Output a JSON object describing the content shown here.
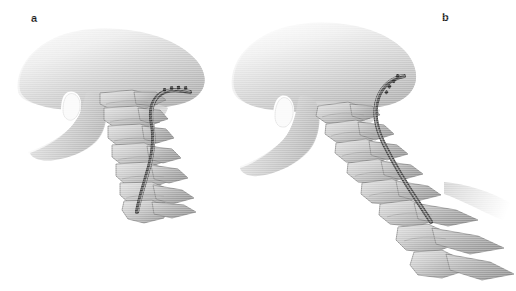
{
  "figure": {
    "background_color": "#ffffff",
    "width": 516,
    "height": 291,
    "type": "medical-illustration",
    "view": "lateral oblique",
    "palette": {
      "background": "#ffffff",
      "bone_light": "#d9d9d9",
      "bone_mid": "#b4b4b4",
      "bone_shadow": "#8e8e8e",
      "bone_outline": "#6e6e6e",
      "soft_tissue_light": "#ededed",
      "soft_tissue_mid": "#c6c6c6",
      "soft_tissue_shadow": "#a0a0a0",
      "lead_dark": "#4a4a4a",
      "lead_mid": "#7a7a7a",
      "lead_highlight": "#cfcfcf",
      "label_text": "#1a1a1a"
    }
  },
  "panels": [
    {
      "id": "a",
      "label": "a",
      "label_x": 31,
      "label_y": 13,
      "posture": "neutral / flexed",
      "description": "Lateral view of skull base, mandible and cervical spine in neutral position with the stimulator lead looped over the occiput and running caudally along the posterior cervical spine.",
      "elements": [
        "skull",
        "mandible",
        "cervical-vertebrae",
        "stimulator-lead"
      ],
      "vertebra_count": 7
    },
    {
      "id": "b",
      "label": "b",
      "label_x": 222,
      "label_y": 12,
      "posture": "extended",
      "description": "Same anatomy with the cervical spine extended/straightened, showing elongation of the lead path and increased traction on the implanted lead.",
      "elements": [
        "skull",
        "mandible",
        "cervical-vertebrae",
        "stimulator-lead"
      ],
      "vertebra_count": 7
    }
  ]
}
